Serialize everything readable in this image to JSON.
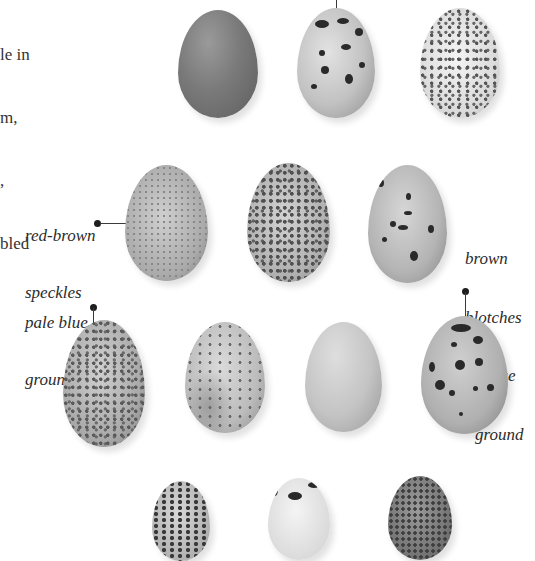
{
  "intro_text": {
    "lines": [
      "le in",
      "m,",
      ",",
      "bled"
    ]
  },
  "annotations": {
    "speckles": {
      "line1": "red-brown",
      "line2": "speckles"
    },
    "pale_blue": {
      "line1": "pale blue",
      "line2": "ground"
    },
    "blotches": {
      "line1": "brown",
      "line2": "blotches",
      "line3": "on blue",
      "line4": "ground"
    }
  },
  "eggs": [
    {
      "id": "row1-egg1",
      "pattern": "plain-dark"
    },
    {
      "id": "row1-egg2",
      "pattern": "bold-blotches"
    },
    {
      "id": "row1-egg3",
      "pattern": "fine-speckles-white"
    },
    {
      "id": "row2-egg1",
      "pattern": "red-brown-speckles"
    },
    {
      "id": "row2-egg2",
      "pattern": "dense-speckles"
    },
    {
      "id": "row2-egg3",
      "pattern": "sparse-blotches"
    },
    {
      "id": "row3-egg1",
      "pattern": "pale-blue-speckled"
    },
    {
      "id": "row3-egg2",
      "pattern": "mottled-pale"
    },
    {
      "id": "row3-egg3",
      "pattern": "plain-pale"
    },
    {
      "id": "row3-egg4",
      "pattern": "brown-blotches-blue"
    },
    {
      "id": "row4-egg1",
      "pattern": "speckled"
    },
    {
      "id": "row4-egg2",
      "pattern": "white-blotched"
    },
    {
      "id": "row4-egg3",
      "pattern": "dark-mottled"
    }
  ],
  "colors": {
    "background": "#ffffff",
    "text": "#2b2b2b",
    "leader": "#3a3a3a"
  }
}
